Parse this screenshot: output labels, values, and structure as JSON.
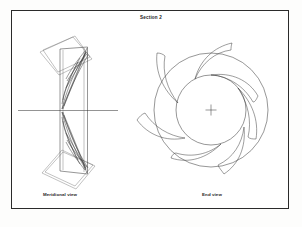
{
  "sheet": {
    "title": "Section 2",
    "border_color": "#2b2b2b",
    "background_color": "#ffffff",
    "line_color": "#2e2e2e"
  },
  "views": [
    {
      "id": "meridional",
      "caption": "Meridional view"
    },
    {
      "id": "end",
      "caption": "End view"
    }
  ],
  "drawing_data": {
    "type": "engineering-drawing",
    "subject": "centrifugal impeller",
    "projection": "two-view orthographic",
    "end_view": {
      "center": [
        211,
        110
      ],
      "outer_radius": 57,
      "inner_radius": 35,
      "blade_count": 7,
      "blade_sweep": "backswept",
      "center_mark": "crosshair"
    },
    "meridional_view": {
      "axis_line": {
        "x1": 18,
        "y1": 110,
        "x2": 118,
        "y2": 110
      },
      "body": {
        "x1": 60,
        "y1": 47,
        "x2": 88,
        "y2": 175
      },
      "end_disc_count": 2,
      "disc_tilt_degrees": 22
    }
  }
}
